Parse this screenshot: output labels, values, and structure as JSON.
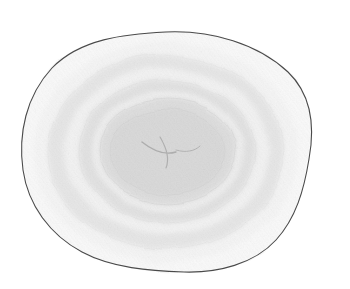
{
  "image": {
    "title": "Concentric contour sketch",
    "medium": "pencil drawing",
    "subject": "irregular rounded blob with nested contour bands",
    "width": 350,
    "height": 289,
    "background_color": "#ffffff"
  },
  "chart_data": {
    "type": "contour",
    "subtitle": "",
    "xlabel": "",
    "ylabel": "",
    "grid": false,
    "legend_position": "none",
    "axis_ticks_visible": false,
    "tick_labels": [],
    "annotations": [],
    "center": {
      "x": 166,
      "y": 152
    },
    "xlim": [
      0,
      350
    ],
    "ylim": [
      0,
      289
    ],
    "level_count": 8,
    "levels": [
      {
        "index": 0,
        "name": "outer-boundary",
        "fill": "#f4f4f4",
        "rx": 145,
        "ry": 120,
        "opacity": 1.0,
        "outlined": true,
        "outline_color": "#4a4a4a",
        "outline_width": 1.1
      },
      {
        "index": 1,
        "name": "ring-band-1",
        "fill": "#ebebeb",
        "rx": 133,
        "ry": 110,
        "opacity": 1.0,
        "outlined": false,
        "outline_color": "#9a9a9a",
        "outline_width": 0.4
      },
      {
        "index": 2,
        "name": "ring-band-2",
        "fill": "#cfcfcf",
        "rx": 118,
        "ry": 97,
        "opacity": 1.0,
        "outlined": false,
        "outline_color": "#999999",
        "outline_width": 0.4
      },
      {
        "index": 3,
        "name": "ring-band-3",
        "fill": "#e6e6e6",
        "rx": 102,
        "ry": 83,
        "opacity": 1.0,
        "outlined": false,
        "outline_color": "#9a9a9a",
        "outline_width": 0.4
      },
      {
        "index": 4,
        "name": "ring-band-4",
        "fill": "#c6c6c6",
        "rx": 88,
        "ry": 71,
        "opacity": 1.0,
        "outlined": false,
        "outline_color": "#8f8f8f",
        "outline_width": 0.4
      },
      {
        "index": 5,
        "name": "ring-band-5",
        "fill": "#dedede",
        "rx": 76,
        "ry": 60,
        "opacity": 1.0,
        "outlined": false,
        "outline_color": "#929292",
        "outline_width": 0.4
      },
      {
        "index": 6,
        "name": "ring-band-6",
        "fill": "#bdbdbd",
        "rx": 68,
        "ry": 52,
        "opacity": 1.0,
        "outlined": true,
        "outline_color": "#8a8a8a",
        "outline_width": 0.8
      },
      {
        "index": 7,
        "name": "inner-core",
        "fill": "#b4b4b4",
        "rx": 58,
        "ry": 42,
        "opacity": 1.0,
        "outlined": true,
        "outline_color": "#8d8d8d",
        "outline_width": 0.7
      }
    ],
    "core_marks": [
      {
        "name": "core-mark-1",
        "color": "#8c8c8c",
        "width": 1.4
      },
      {
        "name": "core-mark-2",
        "color": "#909090",
        "width": 1.2
      },
      {
        "name": "core-mark-3",
        "color": "#949494",
        "width": 1.0
      }
    ],
    "texture": {
      "name": "diagonal-pencil-hatching",
      "angle_degrees": -38,
      "spacing_px": 3,
      "stroke_color": "#8a8a8a",
      "stroke_opacity": 0.16,
      "stroke_width": 0.7
    }
  }
}
